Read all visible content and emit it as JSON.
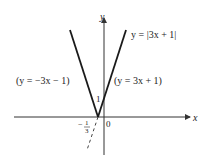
{
  "figure": {
    "axes": {
      "x_label": "x",
      "y_label": "y",
      "origin_label": "0"
    },
    "curves": [
      {
        "name": "absolute-value",
        "label": "y = |3x + 1|"
      },
      {
        "name": "left-branch",
        "label": "(y = −3x − 1)"
      },
      {
        "name": "right-branch",
        "label": "(y = 3x + 1)"
      }
    ],
    "annotations": {
      "y_intercept": "1",
      "x_intercept_sign": "−",
      "x_intercept_num": "1",
      "x_intercept_den": "3"
    },
    "colors": {
      "line": "#1a1a1a",
      "axis": "#333333"
    }
  }
}
